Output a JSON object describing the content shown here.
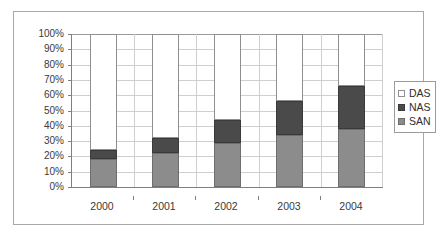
{
  "chart_data": {
    "type": "bar",
    "subtype": "stacked-column-100",
    "title": "",
    "subtitle": "",
    "xlabel": "",
    "ylabel": "",
    "categories": [
      "2000",
      "2001",
      "2002",
      "2003",
      "2004"
    ],
    "series": [
      {
        "name": "SAN",
        "values": [
          18,
          22,
          29,
          34,
          38
        ],
        "color": "#8c8c8c"
      },
      {
        "name": "NAS",
        "values": [
          6,
          10,
          15,
          22,
          28
        ],
        "color": "#4a4a4a"
      },
      {
        "name": "DAS",
        "values": [
          76,
          68,
          56,
          44,
          34
        ],
        "color": "#ffffff"
      }
    ],
    "stack_order_bottom_to_top": [
      "SAN",
      "NAS",
      "DAS"
    ],
    "cumulative_tops": {
      "SAN": [
        18,
        22,
        29,
        34,
        38
      ],
      "NAS": [
        24,
        32,
        44,
        56,
        66
      ],
      "DAS": [
        100,
        100,
        100,
        100,
        100
      ]
    },
    "ylim": [
      0,
      100
    ],
    "y_tick_step": 10,
    "y_tick_labels": [
      "100%",
      "90%",
      "80%",
      "70%",
      "60%",
      "50%",
      "40%",
      "30%",
      "20%",
      "10%",
      "0%"
    ],
    "y_tick_values": [
      100,
      90,
      80,
      70,
      60,
      50,
      40,
      30,
      20,
      10,
      0
    ],
    "x_tick_labels": [
      "2000",
      "2001",
      "2002",
      "2003",
      "2004"
    ],
    "grid": {
      "horizontal": true,
      "vertical": true
    },
    "legend": {
      "position": "right",
      "entries": [
        {
          "label": "DAS",
          "swatch": "das"
        },
        {
          "label": "NAS",
          "swatch": "nas"
        },
        {
          "label": "SAN",
          "swatch": "san"
        }
      ]
    },
    "colors": {
      "san": "#8c8c8c",
      "nas": "#4a4a4a",
      "das": "#ffffff",
      "gridline": "#cfcfcf",
      "axis": "#7f7f7f",
      "frame": "#a8a8a8",
      "text": "#3a3a3a"
    }
  }
}
